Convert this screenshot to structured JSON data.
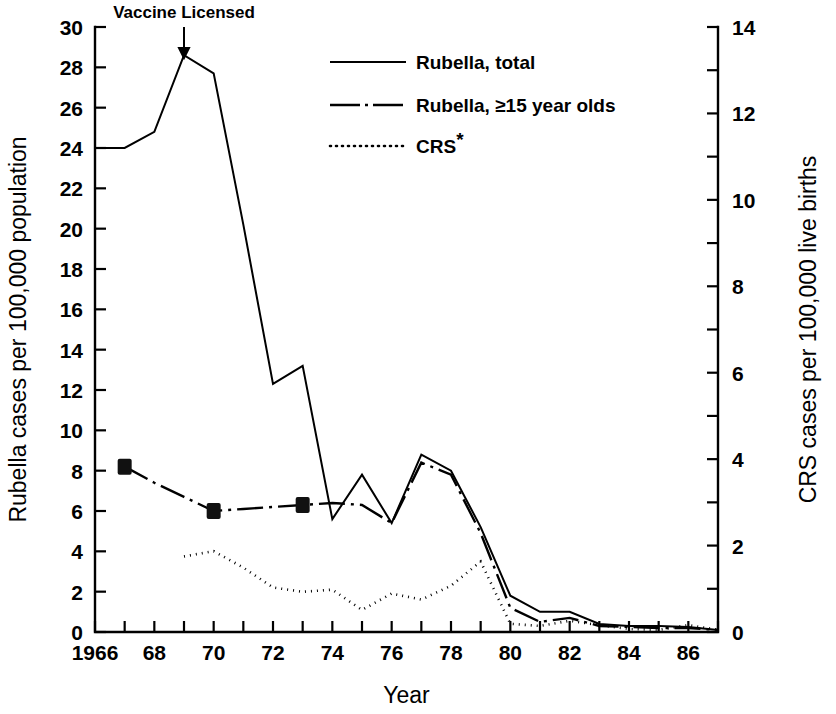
{
  "figure": {
    "background_color": "#ffffff",
    "ink_color": "#000000"
  },
  "annotation": {
    "vaccine_label": "Vaccine Licensed",
    "vaccine_year": 1969,
    "arrow_icon": "down-arrow-icon"
  },
  "legend": {
    "position": "top-right-inside",
    "entries": [
      {
        "label": "Rubella, total",
        "style": "solid",
        "key": "rubella_total"
      },
      {
        "label": "Rubella, ≥15 year olds",
        "style": "dash-dot",
        "key": "rubella_15plus"
      },
      {
        "label": "CRS",
        "superscript": "*",
        "style": "dotted",
        "key": "crs"
      }
    ]
  },
  "chart_data": {
    "type": "line",
    "title": "",
    "subtitle": "",
    "xlabel": "Year",
    "ylabel": "Rubella cases per 100,000 population",
    "y2label": "CRS cases per 100,000 live births",
    "grid": false,
    "xlim": [
      1966,
      1987
    ],
    "ylim": [
      0,
      30
    ],
    "y2lim": [
      0,
      14
    ],
    "x": [
      1966,
      1967,
      1968,
      1969,
      1970,
      1971,
      1972,
      1973,
      1974,
      1975,
      1976,
      1977,
      1978,
      1979,
      1980,
      1981,
      1982,
      1983,
      1984,
      1985,
      1986,
      1987
    ],
    "xticks": [
      1966,
      1967,
      1968,
      1969,
      1970,
      1971,
      1972,
      1973,
      1974,
      1975,
      1976,
      1977,
      1978,
      1979,
      1980,
      1981,
      1982,
      1983,
      1984,
      1985,
      1986,
      1987
    ],
    "xtick_labels": [
      "1966",
      "",
      "68",
      "",
      "70",
      "",
      "72",
      "",
      "74",
      "",
      "76",
      "",
      "78",
      "",
      "80",
      "",
      "82",
      "",
      "84",
      "",
      "86",
      ""
    ],
    "yticks": [
      0,
      2,
      4,
      6,
      8,
      10,
      12,
      14,
      16,
      18,
      20,
      22,
      24,
      26,
      28,
      30
    ],
    "ytick_labels": [
      "0",
      "2",
      "4",
      "6",
      "8",
      "10",
      "12",
      "14",
      "16",
      "18",
      "20",
      "22",
      "24",
      "26",
      "28",
      "30"
    ],
    "y2ticks": [
      0,
      1,
      2,
      3,
      4,
      5,
      6,
      7,
      8,
      9,
      10,
      11,
      12,
      13,
      14
    ],
    "y2tick_labels": [
      "0",
      "",
      "2",
      "",
      "4",
      "",
      "6",
      "",
      "8",
      "",
      "10",
      "",
      "12",
      "",
      "14"
    ],
    "series": [
      {
        "name": "Rubella, total",
        "key": "rubella_total",
        "axis": "left",
        "style": "solid",
        "stroke_width": 2.0,
        "values": [
          24.0,
          24.0,
          24.8,
          28.6,
          27.7,
          20.2,
          12.3,
          13.2,
          5.6,
          7.8,
          5.4,
          8.8,
          8.0,
          5.2,
          1.8,
          1.0,
          1.0,
          0.4,
          0.3,
          0.3,
          0.25,
          0.1
        ]
      },
      {
        "name": "Rubella, ≥15 year olds",
        "key": "rubella_15plus",
        "axis": "left",
        "style": "dash-dot",
        "stroke_width": 2.4,
        "values": [
          null,
          8.2,
          7.4,
          6.7,
          6.0,
          6.1,
          6.2,
          6.3,
          6.4,
          6.3,
          5.4,
          8.4,
          7.8,
          4.9,
          1.2,
          0.5,
          0.7,
          0.3,
          0.25,
          0.2,
          0.2,
          0.1
        ],
        "markers": [
          {
            "x": 1967,
            "y": 8.2
          },
          {
            "x": 1970,
            "y": 6.0
          },
          {
            "x": 1973,
            "y": 6.3
          }
        ],
        "marker_shape": "square"
      },
      {
        "name": "CRS",
        "key": "crs",
        "axis": "right",
        "style": "dotted",
        "stroke_width": 2.6,
        "values_left_scale": [
          null,
          null,
          null,
          3.75,
          4.0,
          3.2,
          2.2,
          2.0,
          2.1,
          1.1,
          1.9,
          1.6,
          2.3,
          3.5,
          0.4,
          0.3,
          0.55,
          0.35,
          0.15,
          0.1,
          0.35,
          0.1
        ],
        "values": [
          null,
          null,
          null,
          1.75,
          1.87,
          1.49,
          1.03,
          0.93,
          0.98,
          0.51,
          0.89,
          0.75,
          1.07,
          1.63,
          0.19,
          0.14,
          0.26,
          0.16,
          0.07,
          0.05,
          0.16,
          0.05
        ]
      }
    ],
    "annotations": [
      {
        "text": "Vaccine Licensed",
        "x": 1969,
        "y": 30,
        "arrow": "down"
      }
    ]
  }
}
